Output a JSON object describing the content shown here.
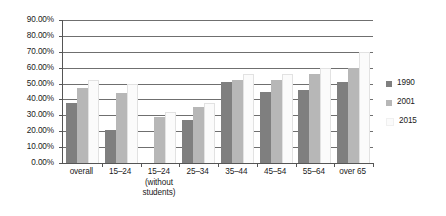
{
  "chart_data": {
    "type": "bar",
    "title": "",
    "subtitle": "",
    "xlabel": "",
    "ylabel": "",
    "categories": [
      "overall",
      "15–24",
      "15–24\n(without\nstudents)",
      "25–34",
      "35–44",
      "45–54",
      "55–64",
      "over 65"
    ],
    "series": [
      {
        "name": "1990",
        "color": "#7f7f7f",
        "values": [
          37.5,
          21.0,
          null,
          27.0,
          51.0,
          45.0,
          46.0,
          51.0
        ]
      },
      {
        "name": "2001",
        "color": "#b7b7b7",
        "values": [
          47.0,
          44.0,
          29.0,
          35.0,
          52.0,
          52.0,
          56.0,
          59.5
        ]
      },
      {
        "name": "2015",
        "color": "#fbfbfb",
        "values": [
          52.5,
          50.0,
          32.0,
          38.0,
          56.0,
          56.0,
          60.0,
          70.0
        ]
      }
    ],
    "ylim": [
      0,
      90
    ],
    "ytick_values": [
      0,
      10,
      20,
      30,
      40,
      50,
      60,
      70,
      80,
      90
    ],
    "ytick_labels": [
      "0.00%",
      "10.00%",
      "20.00%",
      "30.00%",
      "40.00%",
      "50.00%",
      "60.00%",
      "70.00%",
      "80.00%",
      "90.00%"
    ],
    "grid": true,
    "legend_position": "right",
    "legend_entries": [
      "1990",
      "2001",
      "2015"
    ]
  }
}
